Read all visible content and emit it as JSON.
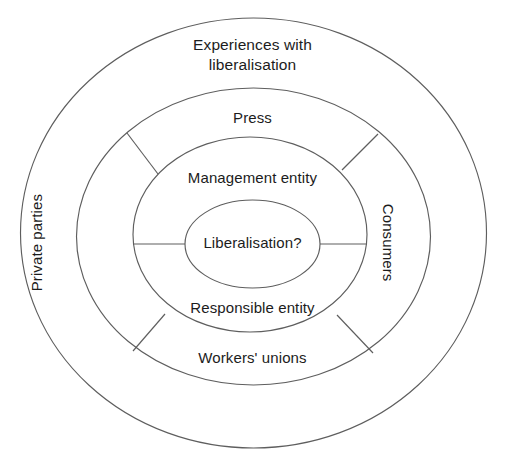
{
  "diagram": {
    "type": "concentric-rings",
    "background_color": "#ffffff",
    "stroke_color": "#5e5e5e",
    "text_color": "#1c1c1c",
    "center": {
      "x": 253.5,
      "y": 233
    },
    "rings": [
      {
        "level": 4,
        "name": "outer-ring",
        "rx": 233,
        "ry": 215,
        "label": "Experiences with\nliberalisation",
        "label_position": "top"
      },
      {
        "level": 3,
        "name": "middle-ring",
        "rx": 177,
        "ry": 148,
        "labels": {
          "top": "Press",
          "bottom": "Workers' unions",
          "left": "Private parties",
          "right": "Consumers"
        }
      },
      {
        "level": 2,
        "name": "inner-ring",
        "rx": 117,
        "ry": 97,
        "labels": {
          "top": "Management entity",
          "bottom": "Responsible entity"
        }
      },
      {
        "level": 1,
        "name": "core",
        "rx": 68,
        "ry": 44,
        "label": "Liberalisation?"
      }
    ],
    "labels": {
      "outer_top_line1": "Experiences with",
      "outer_top_line2": "liberalisation",
      "middle_top": "Press",
      "middle_bottom": "Workers' unions",
      "middle_left": "Private parties",
      "middle_right": "Consumers",
      "inner_top": "Management entity",
      "inner_bottom": "Responsible entity",
      "core": "Liberalisation?"
    },
    "dividers": {
      "diagonal_count": 4,
      "horizontal_count": 2,
      "description": "Four 45-degree radial lines between the middle and inner ellipses, plus two horizontal lines between the inner ellipse and the core ellipse."
    }
  }
}
